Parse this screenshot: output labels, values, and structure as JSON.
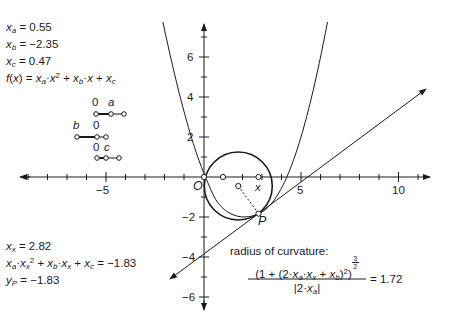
{
  "params": {
    "xa_label": "x",
    "xa_sub": "a",
    "xa_value": "= 0.55",
    "xb_label": "x",
    "xb_sub": "b",
    "xb_value": "= −2.35",
    "xc_label": "x",
    "xc_sub": "c",
    "xc_value": "= 0.47",
    "fx_text": "f(x) = xₐ·x² + x_b·x + x_c"
  },
  "sliders": {
    "a": {
      "zero_label": "0",
      "name_label": "a"
    },
    "b": {
      "zero_label": "0",
      "name_label": "b"
    },
    "c": {
      "zero_label": "0",
      "name_label": "c"
    }
  },
  "results": {
    "xx_value": "= 2.82",
    "fxx_value": "= −1.83",
    "yp_value": "= −1.83"
  },
  "curvature": {
    "label": "radius of curvature:",
    "value": "= 1.72",
    "exponent_num": "3",
    "exponent_den": "2"
  },
  "axes": {
    "x_ticks": [
      "−5",
      "5",
      "10"
    ],
    "y_ticks": [
      "6",
      "4",
      "2",
      "−2",
      "−4",
      "−6"
    ],
    "origin_label": "O"
  },
  "points": {
    "x_label": "x",
    "p_label": "P"
  },
  "colors": {
    "stroke": "#1a1a1a",
    "background": "#ffffff"
  }
}
